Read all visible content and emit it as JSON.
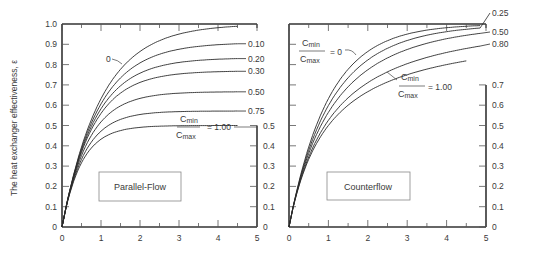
{
  "chart_data": [
    {
      "type": "line",
      "title": "Parallel-Flow",
      "xlabel": "",
      "ylabel": "The heat exchanger effectiveness, ε",
      "xlim": [
        0,
        5
      ],
      "ylim": [
        0,
        1.0
      ],
      "xticks": [
        "0",
        "1",
        "2",
        "3",
        "4",
        "5"
      ],
      "yticks": [
        "0",
        "0.1",
        "0.2",
        "0.3",
        "0.4",
        "0.5",
        "0.6",
        "0.7",
        "0.8",
        "0.9",
        "1.0"
      ],
      "secondary_yticks": [
        "0",
        "0.1",
        "0.2",
        "0.3",
        "0.4",
        "0.5"
      ],
      "grid": false,
      "x": [
        0,
        0.5,
        1,
        1.5,
        2,
        2.5,
        3,
        3.5,
        4,
        4.5
      ],
      "series": [
        {
          "name": "0",
          "values": [
            0,
            0.393,
            0.632,
            0.777,
            0.865,
            0.918,
            0.95,
            0.97,
            0.982,
            0.989
          ]
        },
        {
          "name": "0.10",
          "values": [
            0,
            0.384,
            0.606,
            0.735,
            0.811,
            0.855,
            0.881,
            0.896,
            0.905,
            0.91
          ]
        },
        {
          "name": "0.20",
          "values": [
            0,
            0.376,
            0.582,
            0.697,
            0.758,
            0.792,
            0.811,
            0.821,
            0.826,
            0.829
          ]
        },
        {
          "name": "0.30",
          "values": [
            0,
            0.368,
            0.56,
            0.66,
            0.712,
            0.739,
            0.753,
            0.76,
            0.764,
            0.766
          ]
        },
        {
          "name": "0.50",
          "values": [
            0,
            0.351,
            0.518,
            0.596,
            0.633,
            0.651,
            0.659,
            0.663,
            0.665,
            0.666
          ]
        },
        {
          "name": "0.75",
          "values": [
            0,
            0.332,
            0.471,
            0.53,
            0.555,
            0.565,
            0.569,
            0.571,
            0.571,
            0.571
          ]
        },
        {
          "name": "Cmin/Cmax = 1.00",
          "values": [
            0,
            0.316,
            0.432,
            0.475,
            0.491,
            0.497,
            0.499,
            0.5,
            0.5,
            0.5
          ]
        }
      ],
      "annotations": [
        "0",
        "0.10",
        "0.20",
        "0.30",
        "0.50",
        "0.75",
        "Cmin/Cmax = 1.00"
      ]
    },
    {
      "type": "line",
      "title": "Counterflow",
      "xlabel": "",
      "ylabel": "",
      "xlim": [
        0,
        5
      ],
      "ylim": [
        0,
        1.0
      ],
      "xticks": [
        "0",
        "1",
        "2",
        "3",
        "4",
        "5"
      ],
      "secondary_yticks": [
        "0",
        "0.1",
        "0.2",
        "0.3",
        "0.4",
        "0.5",
        "0.6",
        "0.7"
      ],
      "grid": false,
      "x": [
        0,
        0.5,
        1,
        1.5,
        2,
        2.5,
        3,
        3.5,
        4,
        4.5,
        5
      ],
      "series": [
        {
          "name": "Cmin/Cmax = 0",
          "values": [
            0,
            0.393,
            0.632,
            0.777,
            0.865,
            0.918,
            0.95,
            0.97,
            0.982,
            0.989,
            0.993
          ]
        },
        {
          "name": "0.25",
          "values": [
            0,
            0.378,
            0.595,
            0.733,
            0.822,
            0.881,
            0.919,
            0.945,
            0.962,
            0.974,
            0.982
          ]
        },
        {
          "name": "0.50",
          "values": [
            0,
            0.362,
            0.565,
            0.693,
            0.779,
            0.837,
            0.877,
            0.905,
            0.926,
            0.941,
            0.952
          ]
        },
        {
          "name": "0.80",
          "values": [
            0,
            0.345,
            0.532,
            0.652,
            0.733,
            0.79,
            0.832,
            0.863,
            0.887,
            0.905,
            0.919
          ]
        },
        {
          "name": "Cmin/Cmax = 1.00",
          "values": [
            0,
            0.333,
            0.5,
            0.6,
            0.667,
            0.714,
            0.75,
            0.778,
            0.8,
            0.818
          ]
        }
      ],
      "annotations": [
        "Cmin/Cmax = 0",
        "0.25",
        "0.50",
        "0.80",
        "Cmin/Cmax = 1.00"
      ]
    }
  ],
  "labels": {
    "ylabel": "The heat exchanger effectiveness, ε",
    "left_box": "Parallel-Flow",
    "right_box": "Counterflow",
    "cmin": "C",
    "cmin_sub": "min",
    "cmax": "C",
    "cmax_sub": "max",
    "eq_zero": "= 0",
    "eq_one": "= 1.00",
    "zero_curve": "0",
    "parallel_curve_labels": [
      "0.10",
      "0.20",
      "0.30",
      "0.50",
      "0.75"
    ],
    "counter_curve_labels": [
      "0.25",
      "0.50",
      "0.80"
    ]
  }
}
